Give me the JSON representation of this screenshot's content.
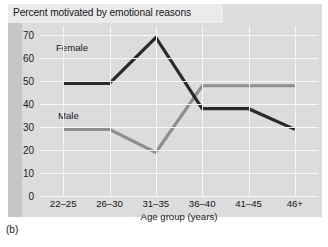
{
  "figure": {
    "caption": "(b)"
  },
  "chart_data": {
    "type": "line",
    "title": "Percent motivated by emotional reasons",
    "xlabel": "Age group (years)",
    "ylabel": "",
    "categories": [
      "22–25",
      "26–30",
      "31–35",
      "36–40",
      "41–45",
      "46+"
    ],
    "yticks": [
      0,
      10,
      20,
      30,
      40,
      50,
      60,
      70
    ],
    "ylim": [
      0,
      74
    ],
    "grid": true,
    "legend": "inline-labels",
    "series": [
      {
        "name": "Female",
        "color": "#2a2a2a",
        "values": [
          49,
          49,
          69,
          38,
          38,
          29
        ]
      },
      {
        "name": "Male",
        "color": "#8e8e8e",
        "values": [
          29,
          29,
          19,
          48,
          48,
          48
        ]
      }
    ],
    "colors": {
      "panel_background": "#dcdcdc",
      "left_band": "#c6c6c6",
      "title_band": "#ebebeb",
      "gridline": "#f7f7f7",
      "text": "#15161a"
    }
  }
}
